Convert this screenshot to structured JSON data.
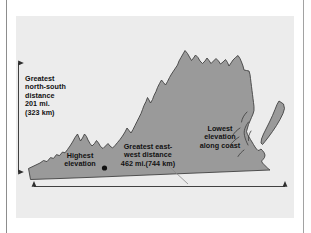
{
  "figure": {
    "panel_background": "#ececec",
    "map_fill": "#9a9a9a",
    "map_outline": "#3a3a3a",
    "text_color": "#111111"
  },
  "annotations": {
    "north_south": {
      "label": "Greatest\nnorth-south\ndistance\n201 mi.\n(323 km)",
      "value_mi": 201,
      "value_km": 323,
      "arrow": "vertical-double-headed"
    },
    "east_west": {
      "label": "Greatest east-\nwest distance\n462 mi.(744 km)",
      "value_mi": 462,
      "value_km": 744,
      "arrow": "horizontal-double-headed"
    },
    "highest_elevation": {
      "label": "Highest\nelevation",
      "marker": "filled-dot"
    },
    "lowest_elevation": {
      "label": "Lowest\nelevation\nalong coast"
    }
  }
}
